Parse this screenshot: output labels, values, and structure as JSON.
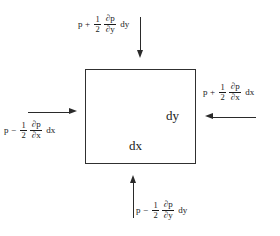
{
  "diagram": {
    "background_color": "#ffffff",
    "line_color": "#2a2a2a",
    "text_color": "#1a1a1a",
    "element": {
      "name": "fluid-element-rectangle",
      "width_label": "dx",
      "height_label": "dy"
    },
    "labels": {
      "top": {
        "name": "top-pressure-label",
        "base": "p",
        "operator": "+",
        "coefficient_numerator": "1",
        "coefficient_denominator": "2",
        "derivative_numerator": "∂p",
        "derivative_denominator": "∂y",
        "differential": "dy",
        "plain_text": "p + 1/2 ∂p/∂y dy",
        "arrow_direction": "down"
      },
      "right": {
        "name": "right-pressure-label",
        "base": "p",
        "operator": "+",
        "coefficient_numerator": "1",
        "coefficient_denominator": "2",
        "derivative_numerator": "∂p",
        "derivative_denominator": "∂x",
        "differential": "dx",
        "plain_text": "p + 1/2 ∂p/∂x dx",
        "arrow_direction": "left"
      },
      "left": {
        "name": "left-pressure-label",
        "base": "p",
        "operator": "−",
        "coefficient_numerator": "1",
        "coefficient_denominator": "2",
        "derivative_numerator": "∂p",
        "derivative_denominator": "∂x",
        "differential": "dx",
        "plain_text": "p − 1/2 ∂p/∂x dx",
        "arrow_direction": "right"
      },
      "bottom": {
        "name": "bottom-pressure-label",
        "base": "p",
        "operator": "−",
        "coefficient_numerator": "1",
        "coefficient_denominator": "2",
        "derivative_numerator": "∂p",
        "derivative_denominator": "∂y",
        "differential": "dy",
        "plain_text": "p − 1/2 ∂p/∂y dy",
        "arrow_direction": "up"
      }
    }
  }
}
